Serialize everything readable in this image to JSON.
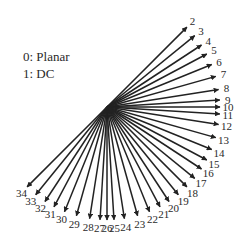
{
  "legend": {
    "items": [
      {
        "label": "0: Planar"
      },
      {
        "label": "1: DC"
      }
    ]
  },
  "diagram": {
    "center": [
      107,
      107
    ],
    "radius": 113,
    "color": "#222222",
    "modes": [
      {
        "id": 2,
        "dx": 32,
        "dy": -32
      },
      {
        "id": 3,
        "dx": 32,
        "dy": -26
      },
      {
        "id": 4,
        "dx": 32,
        "dy": -21
      },
      {
        "id": 5,
        "dx": 32,
        "dy": -17
      },
      {
        "id": 6,
        "dx": 32,
        "dy": -13
      },
      {
        "id": 7,
        "dx": 32,
        "dy": -9
      },
      {
        "id": 8,
        "dx": 32,
        "dy": -5
      },
      {
        "id": 9,
        "dx": 32,
        "dy": -2
      },
      {
        "id": 10,
        "dx": 32,
        "dy": 0
      },
      {
        "id": 11,
        "dx": 32,
        "dy": 2
      },
      {
        "id": 12,
        "dx": 32,
        "dy": 5
      },
      {
        "id": 13,
        "dx": 32,
        "dy": 9
      },
      {
        "id": 14,
        "dx": 32,
        "dy": 13
      },
      {
        "id": 15,
        "dx": 32,
        "dy": 17
      },
      {
        "id": 16,
        "dx": 32,
        "dy": 21
      },
      {
        "id": 17,
        "dx": 32,
        "dy": 26
      },
      {
        "id": 18,
        "dx": 32,
        "dy": 32
      },
      {
        "id": 19,
        "dx": 26,
        "dy": 32
      },
      {
        "id": 20,
        "dx": 21,
        "dy": 32
      },
      {
        "id": 21,
        "dx": 17,
        "dy": 32
      },
      {
        "id": 22,
        "dx": 13,
        "dy": 32
      },
      {
        "id": 23,
        "dx": 9,
        "dy": 32
      },
      {
        "id": 24,
        "dx": 5,
        "dy": 32
      },
      {
        "id": 25,
        "dx": 2,
        "dy": 32
      },
      {
        "id": 26,
        "dx": 0,
        "dy": 32
      },
      {
        "id": 27,
        "dx": -2,
        "dy": 32
      },
      {
        "id": 28,
        "dx": -5,
        "dy": 32
      },
      {
        "id": 29,
        "dx": -9,
        "dy": 32
      },
      {
        "id": 30,
        "dx": -13,
        "dy": 32
      },
      {
        "id": 31,
        "dx": -17,
        "dy": 32
      },
      {
        "id": 32,
        "dx": -21,
        "dy": 32
      },
      {
        "id": 33,
        "dx": -26,
        "dy": 32
      },
      {
        "id": 34,
        "dx": -32,
        "dy": 32
      }
    ]
  }
}
